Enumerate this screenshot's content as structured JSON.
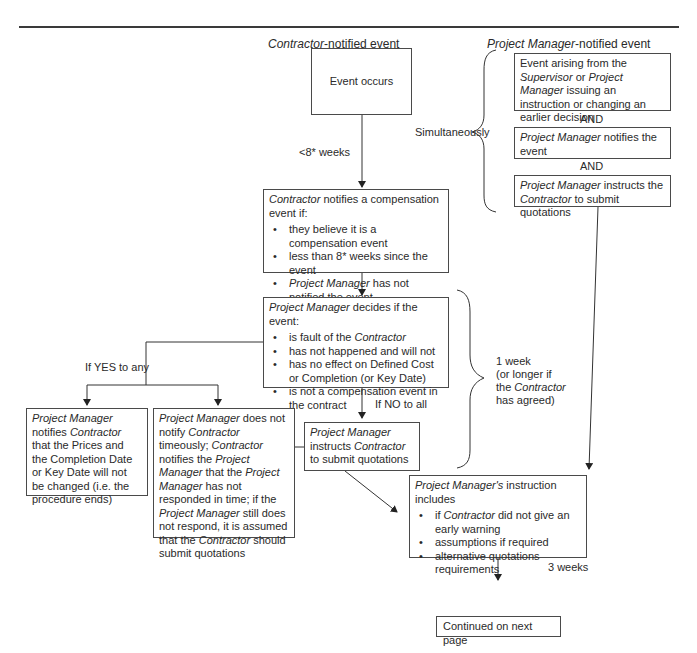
{
  "headers": {
    "contractor_column": {
      "italic": "Contractor",
      "rest": "-notified event"
    },
    "pm_column": {
      "italic": "Project Manager",
      "rest": "-notified event"
    }
  },
  "contractor_flow": {
    "event_occurs": "Event occurs",
    "time_limit_label": "<8* weeks",
    "notify_box": {
      "intro_italic": "Contractor",
      "intro_rest": " notifies a compensation event if:",
      "bullets": [
        "they believe it is a compensation event",
        "less than 8* weeks since the event",
        "Project Manager has not notified the event"
      ]
    }
  },
  "pm_flow": {
    "simultaneously_label": "Simultaneously",
    "box1": {
      "a": "Event arising from the ",
      "b": "Supervisor",
      "c": " or ",
      "d": "Project Manager",
      "e": " issuing an instruction or changing an earlier decision"
    },
    "and1": "AND",
    "box2": {
      "a": "Project Manager",
      "b": " notifies the event"
    },
    "and2": "AND",
    "box3": {
      "a": "Project Manager",
      "b": " instructs the ",
      "c": "Contractor",
      "d": " to submit quotations"
    }
  },
  "decision": {
    "intro_italic": "Project Manager",
    "intro_rest": " decides if the event:",
    "bullets": [
      {
        "a": "is fault of the ",
        "b": "Contractor"
      },
      {
        "a": "has not happened and will not",
        "b": ""
      },
      {
        "a": "has no effect on Defined Cost or Completion (or Key Date)",
        "b": ""
      },
      {
        "a": "is not a compensation event in the contract",
        "b": ""
      }
    ],
    "yes_label": "If YES to any",
    "no_label": "If NO to all",
    "timeframe_label": [
      "1 week",
      "(or longer if",
      "the ",
      "Contractor",
      "has agreed)"
    ]
  },
  "outcomes": {
    "pm_notifies_no_change": {
      "a": "Project Manager",
      "b": " notifies ",
      "c": "Contractor",
      "d": " that the Prices and the Completion Date or Key Date will not be changed (i.e. the procedure ends)"
    },
    "pm_not_timeous": {
      "a": "Project Manager",
      "b": " does not notify ",
      "c": "Contractor",
      "d": " timeously; ",
      "e": "Contractor",
      "f": " notifies the ",
      "g": "Project Manager",
      "h": " that the ",
      "i": "Project Manager",
      "j": " has not responded in time; if the ",
      "k": "Project Manager",
      "l": " still does not respond, it is assumed that the ",
      "m": "Contractor",
      "n": " should submit quotations"
    },
    "pm_instructs": {
      "a": "Project Manager",
      "b": " instructs ",
      "c": "Contractor",
      "d": " to submit quotations"
    }
  },
  "instruction_box": {
    "intro_italic": "Project Manager's",
    "intro_rest": " instruction includes",
    "bullets": [
      {
        "a": "if ",
        "b": "Contractor",
        "c": " did not give an early warning"
      },
      {
        "a": "assumptions if required",
        "b": "",
        "c": ""
      },
      {
        "a": "alternative quotations requirements",
        "b": "",
        "c": ""
      }
    ],
    "duration_label": "3 weeks"
  },
  "footer": {
    "continued": "Continued on next page"
  }
}
